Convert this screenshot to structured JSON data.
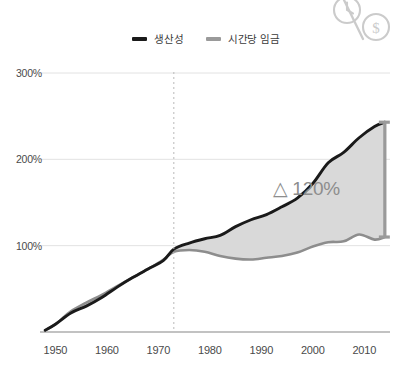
{
  "chart_data": {
    "type": "line",
    "title": "",
    "subtitle": "",
    "xlabel": "",
    "ylabel": "",
    "xlim": [
      1947,
      2015
    ],
    "ylim": [
      0,
      300
    ],
    "xticks": [
      "1950",
      "1960",
      "1970",
      "1980",
      "1990",
      "2000",
      "2010"
    ],
    "xtick_values": [
      1950,
      1960,
      1970,
      1980,
      1990,
      2000,
      2010
    ],
    "yticks": [
      "100%",
      "200%",
      "300%"
    ],
    "ytick_values": [
      100,
      200,
      300
    ],
    "grid": "horizontal",
    "legend_position": "top-center",
    "annotations": [
      {
        "name": "divergence-marker",
        "type": "vertical-dashed-line",
        "x": 1973
      },
      {
        "name": "gap-label",
        "text": "△ 120%",
        "x": 2002,
        "y": 165
      },
      {
        "name": "gap-bracket",
        "type": "vertical-measure-bar",
        "x": 2014,
        "y_from": 110,
        "y_to": 243
      }
    ],
    "series": [
      {
        "name": "생산성",
        "color": "#1a1a1a",
        "x": [
          1948,
          1950,
          1953,
          1956,
          1959,
          1962,
          1965,
          1968,
          1971,
          1973,
          1976,
          1979,
          1982,
          1985,
          1988,
          1991,
          1994,
          1997,
          2000,
          2003,
          2006,
          2009,
          2012,
          2014
        ],
        "values": [
          2,
          9,
          22,
          30,
          40,
          52,
          63,
          73,
          83,
          96,
          103,
          108,
          112,
          122,
          130,
          136,
          145,
          155,
          172,
          196,
          208,
          225,
          238,
          243
        ]
      },
      {
        "name": "시간당 임금",
        "color": "#8d8d8d",
        "x": [
          1948,
          1950,
          1953,
          1956,
          1959,
          1962,
          1965,
          1968,
          1971,
          1973,
          1976,
          1979,
          1982,
          1985,
          1988,
          1991,
          1994,
          1997,
          2000,
          2003,
          2006,
          2009,
          2012,
          2014
        ],
        "values": [
          2,
          9,
          24,
          34,
          43,
          53,
          63,
          73,
          84,
          93,
          95,
          93,
          88,
          85,
          84,
          86,
          88,
          92,
          99,
          104,
          105,
          113,
          107,
          110
        ]
      }
    ],
    "shaded_gap": {
      "name": "productivity-pay-gap",
      "between": [
        "생산성",
        "시간당 임금"
      ],
      "color": "#d9d9d9",
      "value_label": "△ 120%"
    }
  },
  "legend": {
    "items": [
      {
        "label": "생산성",
        "color": "#1a1a1a"
      },
      {
        "label": "시간당 임금",
        "color": "#9a9a9a"
      }
    ]
  },
  "decoration": {
    "icon_name": "clock-percent-dollar-icon",
    "dollar_glyph": "$"
  }
}
